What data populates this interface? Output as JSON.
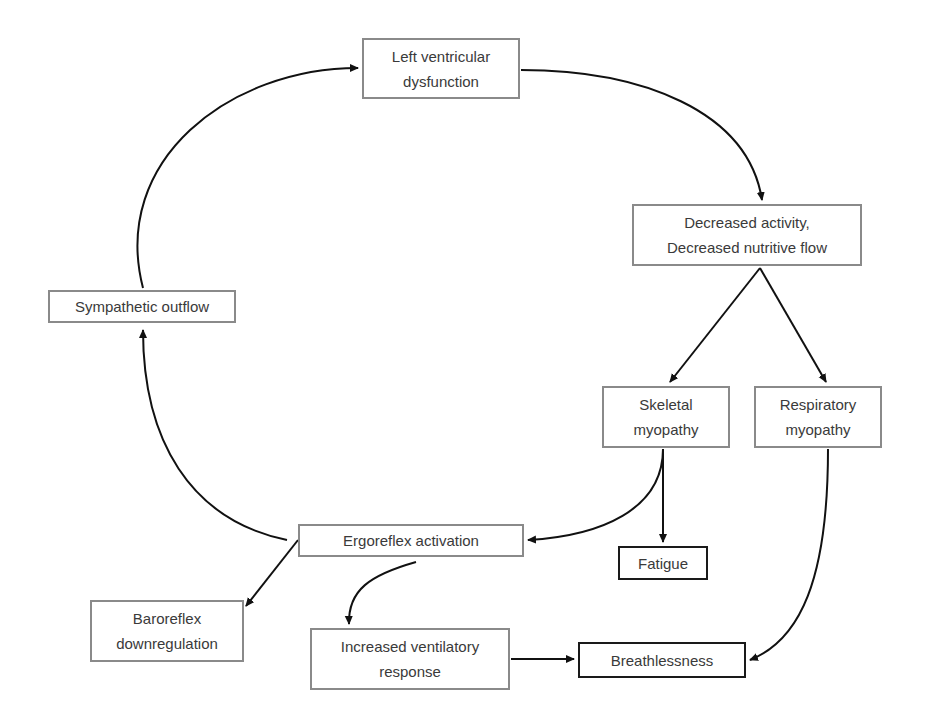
{
  "diagram": {
    "nodes": [
      {
        "id": "lvd",
        "label": "Left ventricular\ndysfunction",
        "x": 362,
        "y": 38,
        "w": 158,
        "h": 61,
        "emphasis": false
      },
      {
        "id": "dec",
        "label": "Decreased activity,\nDecreased nutritive flow",
        "x": 632,
        "y": 204,
        "w": 230,
        "h": 62,
        "emphasis": false
      },
      {
        "id": "sym",
        "label": "Sympathetic outflow",
        "x": 48,
        "y": 290,
        "w": 188,
        "h": 33,
        "emphasis": false
      },
      {
        "id": "skel",
        "label": "Skeletal\nmyopathy",
        "x": 602,
        "y": 386,
        "w": 128,
        "h": 62,
        "emphasis": false
      },
      {
        "id": "resp",
        "label": "Respiratory\nmyopathy",
        "x": 754,
        "y": 386,
        "w": 128,
        "h": 62,
        "emphasis": false
      },
      {
        "id": "ergo",
        "label": "Ergoreflex activation",
        "x": 298,
        "y": 524,
        "w": 226,
        "h": 33,
        "emphasis": false
      },
      {
        "id": "fat",
        "label": "Fatigue",
        "x": 618,
        "y": 546,
        "w": 90,
        "h": 34,
        "emphasis": true
      },
      {
        "id": "baro",
        "label": "Baroreflex\ndownregulation",
        "x": 90,
        "y": 600,
        "w": 154,
        "h": 62,
        "emphasis": false
      },
      {
        "id": "vent",
        "label": "Increased ventilatory\nresponse",
        "x": 310,
        "y": 628,
        "w": 200,
        "h": 62,
        "emphasis": false
      },
      {
        "id": "breath",
        "label": "Breathlessness",
        "x": 578,
        "y": 642,
        "w": 168,
        "h": 36,
        "emphasis": true
      }
    ],
    "edges": [
      {
        "from": "lvd",
        "to": "dec",
        "path": "M521,70 C640,70 748,110 762,200"
      },
      {
        "from": "dec",
        "to": "skel",
        "path": "M760,268 L670,382"
      },
      {
        "from": "dec",
        "to": "resp",
        "path": "M760,268 L826,382"
      },
      {
        "from": "skel",
        "to": "ergo",
        "path": "M663,449 C663,510 600,536 528,540"
      },
      {
        "from": "skel",
        "to": "fat",
        "path": "M663,449 L663,542"
      },
      {
        "from": "resp",
        "to": "breath",
        "path": "M828,449 C828,580 800,640 750,660"
      },
      {
        "from": "ergo",
        "to": "sym",
        "path": "M287,540 C190,520 143,440 143,330"
      },
      {
        "from": "sym",
        "to": "lvd",
        "path": "M143,288 C110,160 230,68 358,68"
      },
      {
        "from": "ergo",
        "to": "baro",
        "path": "M298,540 L246,606"
      },
      {
        "from": "ergo",
        "to": "vent",
        "path": "M416,562 C370,575 348,590 349,624"
      },
      {
        "from": "vent",
        "to": "breath",
        "path": "M511,659 L574,659"
      }
    ],
    "colors": {
      "box_border": "#8a8a8a",
      "emphasis_border": "#1a1a1a",
      "arrow": "#111111",
      "text": "#3a3a3a"
    }
  }
}
